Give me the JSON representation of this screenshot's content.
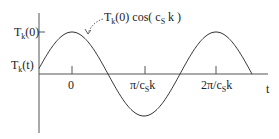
{
  "diagram": {
    "type": "cosine-wave-plot",
    "y_axis_labels": {
      "peak": {
        "main": "T",
        "sub": "k",
        "rest": "(0)"
      },
      "function": {
        "main": "T",
        "sub": "k",
        "rest": "(t)"
      }
    },
    "x_axis_label": "t",
    "x_ticks": [
      {
        "main": "0",
        "sub": "",
        "rest": ""
      },
      {
        "main": "π/c",
        "sub": "S",
        "rest": "k"
      },
      {
        "main": "2π/c",
        "sub": "S",
        "rest": "k"
      }
    ],
    "curve_annotation": {
      "pre": "T",
      "sub1": "k",
      "mid": "(0) cos( c",
      "sub2": "S",
      "post": " k )"
    },
    "colors": {
      "line": "#333333",
      "axis": "#555555",
      "text": "#222222"
    }
  }
}
